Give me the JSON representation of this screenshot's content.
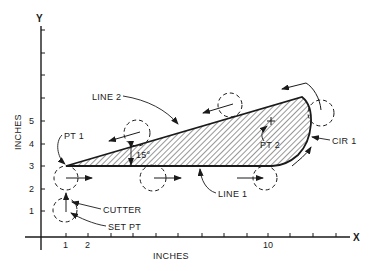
{
  "diagram": {
    "type": "NC cutter-path geometry diagram",
    "axes": {
      "x_axis_label": "X",
      "y_axis_label": "Y",
      "x_units": "INCHES",
      "y_units": "INCHES",
      "x_tick_labels": [
        "1",
        "2",
        "10"
      ],
      "y_tick_labels": [
        "1",
        "2",
        "3",
        "4",
        "5"
      ]
    },
    "labels": {
      "line_2": "LINE 2",
      "line_1": "LINE 1",
      "pt_1": "PT 1",
      "pt_2": "PT 2",
      "cir_1": "CIR 1",
      "cutter": "CUTTER",
      "set_pt": "SET PT",
      "angle": "15°"
    },
    "colors": {
      "ink": "#1a1a1a",
      "background": "#ffffff"
    }
  }
}
